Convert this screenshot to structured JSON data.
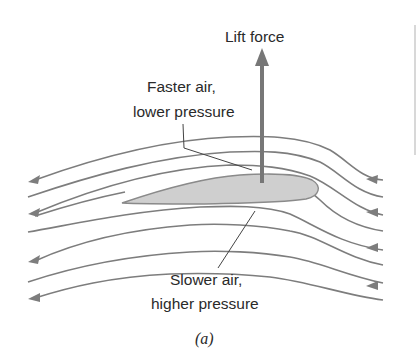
{
  "figure": {
    "type": "airfoil-lift-diagram",
    "labels": {
      "lift": "Lift force",
      "upper_line1": "Faster air,",
      "upper_line2": "lower pressure",
      "lower_line1": "Slower air,",
      "lower_line2": "higher pressure"
    },
    "caption": "(a)",
    "colors": {
      "streamline": "#7d7d7d",
      "airfoil_fill": "#cfcfcf",
      "airfoil_stroke": "#8a8a8a",
      "lift_arrow": "#777777",
      "text": "#2a2a2a",
      "leader_line": "#444444"
    },
    "streamlines": {
      "count": 10,
      "flow_direction": "right-to-left"
    }
  }
}
